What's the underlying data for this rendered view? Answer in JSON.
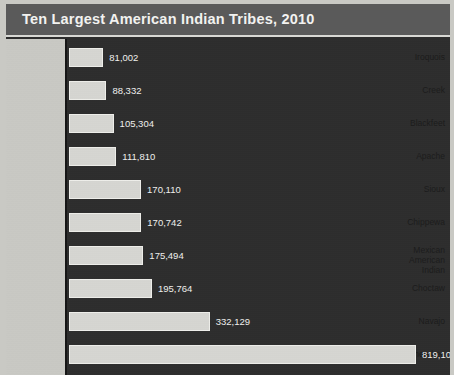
{
  "chart_data": {
    "type": "bar",
    "title": "Ten Largest American Indian Tribes, 2010",
    "orientation": "horizontal",
    "xlabel": "",
    "ylabel": "",
    "grid": false,
    "legend": "none",
    "xlim": [
      0,
      819105
    ],
    "categories": [
      "Iroquois",
      "Creek",
      "Blackfeet",
      "Apache",
      "Sioux",
      "Chippewa",
      "Mexican\nAmerican\nIndian",
      "Choctaw",
      "Navajo",
      "Cherokee"
    ],
    "values": [
      81002,
      88332,
      105304,
      111810,
      170110,
      170742,
      175494,
      195764,
      332129,
      819105
    ],
    "value_labels": [
      "81,002",
      "88,332",
      "105,304",
      "111,810",
      "170,110",
      "170,742",
      "175,494",
      "195,764",
      "332,129",
      "819,105"
    ]
  },
  "colors": {
    "title_band": "#5a5a5a",
    "plot_background": "#2d2d2d",
    "label_panel": "#c9c9c4",
    "bar_fill": "#d6d6d2",
    "title_text": "#f2f2f0",
    "value_text": "#f0f0ee",
    "label_text": "#1b1b1b"
  }
}
